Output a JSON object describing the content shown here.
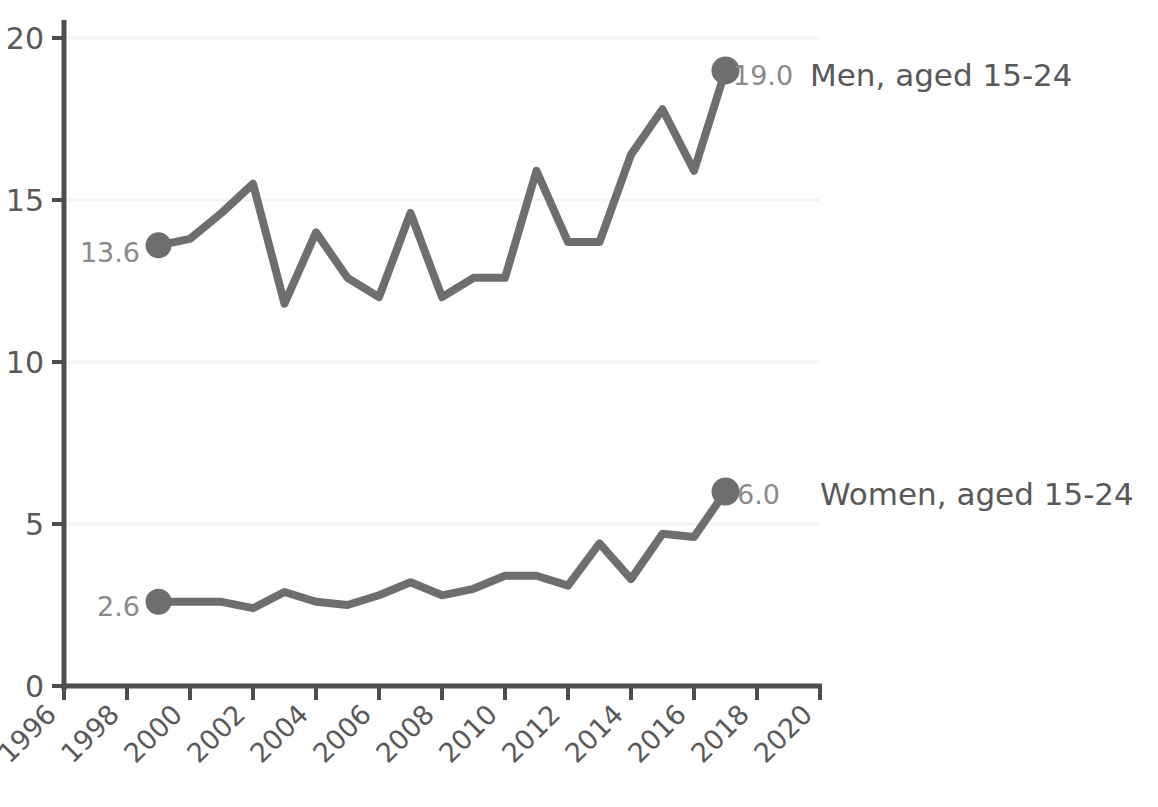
{
  "chart_data": {
    "type": "line",
    "title": "",
    "subtitle": "",
    "xlabel": "",
    "ylabel": "",
    "xlim": [
      1996,
      2020
    ],
    "ylim": [
      0,
      20
    ],
    "x_ticks": [
      1996,
      1998,
      2000,
      2002,
      2004,
      2006,
      2008,
      2010,
      2012,
      2014,
      2016,
      2018,
      2020
    ],
    "x_tick_labels": [
      "1996",
      "1998",
      "2000",
      "2002",
      "2004",
      "2006",
      "2008",
      "2010",
      "2012",
      "2014",
      "2016",
      "2018",
      "2020"
    ],
    "x_tick_rotation": -45,
    "y_ticks": [
      0,
      5,
      10,
      15,
      20
    ],
    "y_tick_labels": [
      "0",
      "5",
      "10",
      "15",
      "20"
    ],
    "grid": "horizontal-faint",
    "legend_position": "right-inline-at-series-end",
    "x": [
      1999,
      2000,
      2001,
      2002,
      2003,
      2004,
      2005,
      2006,
      2007,
      2008,
      2009,
      2010,
      2011,
      2012,
      2013,
      2014,
      2015,
      2016,
      2017
    ],
    "series": [
      {
        "name": "Men, aged 15-24",
        "label": "Men, aged 15-24",
        "color": "#6e6e6e",
        "start_value_label": "13.6",
        "end_value_label": "19.0",
        "values": [
          13.6,
          13.8,
          14.6,
          15.5,
          11.8,
          14.0,
          12.6,
          12.0,
          14.6,
          12.0,
          12.6,
          12.6,
          15.9,
          13.7,
          13.7,
          16.4,
          17.8,
          15.9,
          19.0
        ]
      },
      {
        "name": "Women, aged 15-24",
        "label": "Women, aged 15-24",
        "color": "#6e6e6e",
        "start_value_label": "2.6",
        "end_value_label": "6.0",
        "values": [
          2.6,
          2.6,
          2.6,
          2.4,
          2.9,
          2.6,
          2.5,
          2.8,
          3.2,
          2.8,
          3.0,
          3.4,
          3.4,
          3.1,
          4.4,
          3.3,
          4.7,
          4.6,
          6.0
        ]
      }
    ]
  },
  "axis": {
    "line_color": "#4d4d4d",
    "tick_color": "#4d4d4d",
    "gridline_color": "#f4f4f4"
  },
  "labels": {
    "men_value_end": "19.0",
    "men_series": "Men, aged 15-24",
    "men_value_start": "13.6",
    "women_value_end": "6.0",
    "women_series": "Women, aged 15-24",
    "women_value_start": "2.6",
    "y_0": "0",
    "y_5": "5",
    "y_10": "10",
    "y_15": "15",
    "y_20": "20",
    "x_1996": "1996",
    "x_1998": "1998",
    "x_2000": "2000",
    "x_2002": "2002",
    "x_2004": "2004",
    "x_2006": "2006",
    "x_2008": "2008",
    "x_2010": "2010",
    "x_2012": "2012",
    "x_2014": "2014",
    "x_2016": "2016",
    "x_2018": "2018",
    "x_2020": "2020"
  }
}
